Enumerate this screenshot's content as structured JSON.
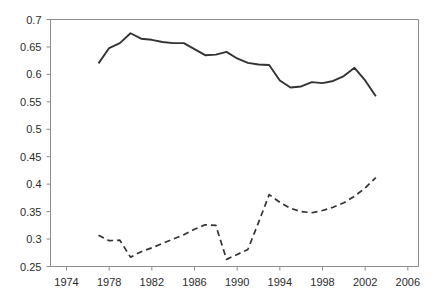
{
  "chart_data": {
    "type": "line",
    "title": "",
    "subtitle": "",
    "xlabel": "",
    "ylabel": "",
    "xlim": [
      1972.5,
      2007.0
    ],
    "ylim": [
      0.25,
      0.7
    ],
    "grid": false,
    "legend_position": "none",
    "x_ticks": [
      1974,
      1978,
      1982,
      1986,
      1990,
      1994,
      1998,
      2002,
      2006
    ],
    "y_ticks": [
      0.25,
      0.3,
      0.35,
      0.4,
      0.45,
      0.5,
      0.55,
      0.6,
      0.65,
      0.7
    ],
    "x_tick_labels": [
      "1974",
      "1978",
      "1982",
      "1986",
      "1990",
      "1994",
      "1998",
      "2002",
      "2006"
    ],
    "y_tick_labels": [
      "0.25",
      "0.3",
      "0.35",
      "0.4",
      "0.45",
      "0.5",
      "0.55",
      "0.6",
      "0.65",
      "0.7"
    ],
    "series": [
      {
        "name": "solid-series",
        "style": "solid",
        "color": "#333333",
        "x": [
          1977,
          1978,
          1979,
          1980,
          1981,
          1982,
          1983,
          1984,
          1985,
          1986,
          1987,
          1988,
          1989,
          1990,
          1991,
          1992,
          1993,
          1994,
          1995,
          1996,
          1997,
          1998,
          1999,
          2000,
          2001,
          2002,
          2003
        ],
        "values": [
          0.62,
          0.648,
          0.657,
          0.675,
          0.665,
          0.663,
          0.659,
          0.657,
          0.657,
          0.646,
          0.635,
          0.636,
          0.641,
          0.629,
          0.621,
          0.618,
          0.617,
          0.589,
          0.576,
          0.578,
          0.586,
          0.584,
          0.588,
          0.597,
          0.612,
          0.589,
          0.56
        ]
      },
      {
        "name": "dashed-series",
        "style": "dashed",
        "color": "#333333",
        "x": [
          1977,
          1978,
          1979,
          1980,
          1981,
          1982,
          1983,
          1984,
          1985,
          1986,
          1987,
          1988,
          1989,
          1990,
          1991,
          1992,
          1993,
          1994,
          1995,
          1996,
          1997,
          1998,
          1999,
          2000,
          2001,
          2002,
          2003
        ],
        "values": [
          0.307,
          0.297,
          0.298,
          0.267,
          0.277,
          0.284,
          0.292,
          0.3,
          0.308,
          0.318,
          0.326,
          0.325,
          0.263,
          0.272,
          0.281,
          0.33,
          0.381,
          0.367,
          0.356,
          0.35,
          0.348,
          0.352,
          0.358,
          0.366,
          0.378,
          0.393,
          0.412
        ]
      }
    ]
  },
  "axes": {
    "frame_color": "#8c8c8c",
    "tick_color": "#8c8c8c",
    "label_color": "#2b2b2b"
  }
}
